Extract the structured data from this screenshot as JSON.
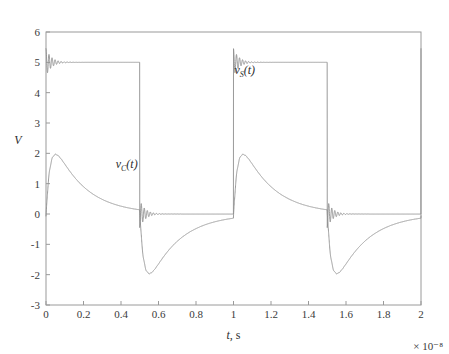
{
  "chart_data": {
    "type": "line",
    "title": "",
    "xlabel": "t, s",
    "ylabel": "V",
    "x_exponent_label": "× 10⁻⁸",
    "xlim": [
      0,
      2
    ],
    "ylim": [
      -3,
      6
    ],
    "xticks": [
      "0",
      "0.2",
      "0.4",
      "0.6",
      "0.8",
      "1",
      "1.2",
      "1.4",
      "1.6",
      "1.8",
      "2"
    ],
    "xtick_values": [
      0,
      0.2,
      0.4,
      0.6,
      0.8,
      1,
      1.2,
      1.4,
      1.6,
      1.8,
      2
    ],
    "yticks": [
      "6",
      "5",
      "4",
      "3",
      "2",
      "1",
      "0",
      "-1",
      "-2",
      "-3"
    ],
    "ytick_values": [
      6,
      5,
      4,
      3,
      2,
      1,
      0,
      -1,
      -2,
      -3
    ],
    "grid": false,
    "legend_position": "inline-annotations",
    "line_color": "#8f8f8f",
    "frame_color": "#9a9a9a",
    "background_color": "#ffffff",
    "series": [
      {
        "name": "v_S(t)",
        "label_text": "v",
        "label_sub": "S",
        "label_tail": "(t)",
        "label_x": 1.06,
        "label_y": 4.62,
        "description": "Square wave source voltage, 5 V high / 0 V low, period 1e-8 s, 50% duty, with damped ringing overshoot at each edge",
        "high_value": 5,
        "low_value": 0,
        "period": 1.0,
        "overshoot_peak": 5.45,
        "undershoot_peak": -0.45,
        "edges": [
          0,
          0.5,
          1.0,
          1.5,
          2.0
        ],
        "ring_frequency": 62,
        "ring_decay": 34
      },
      {
        "name": "v_C(t)",
        "label_text": "v",
        "label_sub": "C",
        "label_tail": "(t)",
        "label_x": 0.43,
        "label_y": 1.52,
        "description": "Capacitor voltage: fast rise to ~2.05 V then exponential decay toward 0; at each falling edge it swings to ~-2.05 V and recovers exponentially",
        "peak_positive": 2.05,
        "peak_negative": -2.05,
        "rise_time_constant": 0.022,
        "decay_time_constant": 0.16,
        "start_value": 1.0,
        "edges": [
          0,
          0.5,
          1.0,
          1.5,
          2.0
        ]
      }
    ],
    "annotations": [
      {
        "text": "v_S(t)",
        "x": 1.06,
        "y": 4.62
      },
      {
        "text": "v_C(t)",
        "x": 0.43,
        "y": 1.52
      }
    ]
  },
  "plot_box": {
    "left": 46,
    "top": 32,
    "right": 421,
    "bottom": 305
  }
}
